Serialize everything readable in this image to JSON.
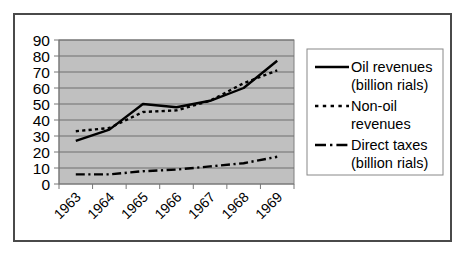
{
  "chart_data": {
    "type": "line",
    "title": "",
    "xlabel": "",
    "ylabel": "",
    "categories": [
      "1963",
      "1964",
      "1965",
      "1966",
      "1967",
      "1968",
      "1969"
    ],
    "yticks": [
      "0",
      "10",
      "20",
      "30",
      "40",
      "50",
      "60",
      "70",
      "80",
      "90"
    ],
    "ylim": [
      0,
      90
    ],
    "grid": true,
    "legend_position": "right",
    "plot_background": "#c0c0c0",
    "series": [
      {
        "name": "oil-revenues",
        "legend_line1": "Oil revenues",
        "legend_line2": "(billion rials)",
        "style": "solid",
        "color": "#000000",
        "values": [
          27,
          34,
          50,
          48,
          52,
          60,
          77
        ]
      },
      {
        "name": "non-oil-revenues",
        "legend_line1": "Non-oil",
        "legend_line2": "revenues",
        "style": "dotted",
        "color": "#000000",
        "values": [
          33,
          35,
          45,
          46,
          52,
          63,
          71
        ]
      },
      {
        "name": "direct-taxes",
        "legend_line1": "Direct taxes",
        "legend_line2": "(billion rials)",
        "style": "dash-dot",
        "color": "#000000",
        "values": [
          6,
          6,
          8,
          9,
          11,
          13,
          17
        ]
      }
    ]
  }
}
